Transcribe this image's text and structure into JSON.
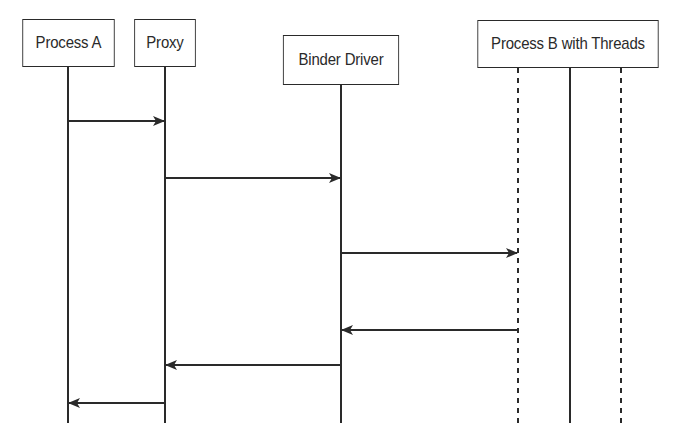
{
  "diagram": {
    "type": "sequence",
    "participants": [
      {
        "id": "process_a",
        "label": "Process A"
      },
      {
        "id": "proxy",
        "label": "Proxy"
      },
      {
        "id": "binder_driver",
        "label": "Binder Driver"
      },
      {
        "id": "process_b",
        "label": "Process B with Threads"
      }
    ],
    "process_b_threads": [
      {
        "style": "dashed"
      },
      {
        "style": "solid"
      },
      {
        "style": "dashed"
      }
    ],
    "messages": [
      {
        "from": "process_a",
        "to": "proxy",
        "direction": "right"
      },
      {
        "from": "proxy",
        "to": "binder_driver",
        "direction": "right"
      },
      {
        "from": "binder_driver",
        "to": "process_b",
        "direction": "right"
      },
      {
        "from": "process_b",
        "to": "binder_driver",
        "direction": "left"
      },
      {
        "from": "binder_driver",
        "to": "proxy",
        "direction": "left"
      },
      {
        "from": "proxy",
        "to": "process_a",
        "direction": "left"
      }
    ],
    "colors": {
      "line": "#2a2a2a",
      "background": "#ffffff"
    }
  }
}
